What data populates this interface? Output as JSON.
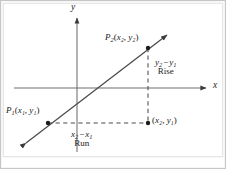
{
  "figure": {
    "kind": "slope-rise-over-run-diagram",
    "width": 226,
    "height": 169,
    "background_color": "#ffffff",
    "border_color": "#b9b9b9",
    "ink_color": "#1b1b1b",
    "axis_color": "#6e6e6e",
    "line_color": "#4a4a4a",
    "dash_color": "#4a4a4a"
  },
  "axes": {
    "x_label": "x",
    "y_label": "y",
    "origin_px": {
      "x": 77,
      "y": 88
    },
    "x_axis_from_px": {
      "x": 14,
      "y": 88
    },
    "x_axis_to_px": {
      "x": 209,
      "y": 88
    },
    "y_axis_from_px": {
      "x": 77,
      "y": 152
    },
    "y_axis_to_px": {
      "x": 77,
      "y": 15
    }
  },
  "line": {
    "name": "secant-line-through-p1-p2",
    "from_px": {
      "x": 21,
      "y": 147
    },
    "to_px": {
      "x": 172,
      "y": 31
    },
    "double_arrow": true
  },
  "points": [
    {
      "id": "p1",
      "name": "point-p1",
      "label": "P₁(x₁, y₁)",
      "label_base": "P",
      "label_sub": "1",
      "coord_x": "x₁",
      "coord_y": "y₁",
      "at_px": {
        "x": 48,
        "y": 123
      }
    },
    {
      "id": "p2",
      "name": "point-p2",
      "label": "P₂(x₂, y₂)",
      "label_base": "P",
      "label_sub": "2",
      "coord_x": "x₂",
      "coord_y": "y₂",
      "at_px": {
        "x": 148,
        "y": 48
      }
    },
    {
      "id": "foot",
      "name": "point-right-angle-corner",
      "label": "(x₂, y₁)",
      "coord_x": "x₂",
      "coord_y": "y₁",
      "at_px": {
        "x": 148,
        "y": 123
      }
    }
  ],
  "annotations": {
    "rise": {
      "expression": "y₂ − y₁",
      "term_a_base": "y",
      "term_a_sub": "2",
      "operator": "−",
      "term_b_base": "y",
      "term_b_sub": "1",
      "word": "Rise"
    },
    "run": {
      "expression": "x₂ − x₁",
      "term_a_base": "x",
      "term_a_sub": "2",
      "operator": "−",
      "term_b_base": "x",
      "term_b_sub": "1",
      "word": "Run"
    }
  },
  "dashed_guides": [
    {
      "name": "vertical-rise-guide",
      "from_px": {
        "x": 148,
        "y": 48
      },
      "to_px": {
        "x": 148,
        "y": 123
      }
    },
    {
      "name": "horizontal-run-guide",
      "from_px": {
        "x": 48,
        "y": 123
      },
      "to_px": {
        "x": 148,
        "y": 123
      }
    }
  ]
}
